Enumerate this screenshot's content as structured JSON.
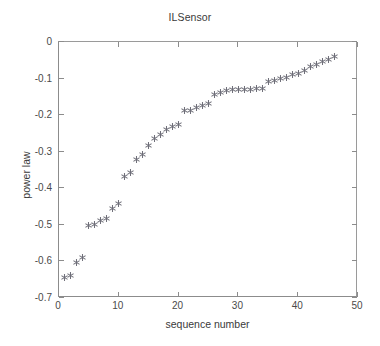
{
  "chart_data": {
    "type": "scatter",
    "title": "ILSensor",
    "xlabel": "sequence number",
    "ylabel": "power law",
    "xlim": [
      0,
      50
    ],
    "ylim": [
      -0.7,
      0
    ],
    "xticks": [
      0,
      10,
      20,
      30,
      40,
      50
    ],
    "yticks": [
      0,
      -0.1,
      -0.2,
      -0.3,
      -0.4,
      -0.5,
      -0.6,
      -0.7
    ],
    "xtick_labels": [
      "0",
      "10",
      "20",
      "30",
      "40",
      "50"
    ],
    "ytick_labels": [
      "0",
      "-0.1",
      "-0.2",
      "-0.3",
      "-0.4",
      "-0.5",
      "-0.6",
      "-0.7"
    ],
    "grid": false,
    "legend": null,
    "marker": "asterisk",
    "marker_color": "#6e6e78",
    "axis_color": "#8c8c8c",
    "background": "#ffffff",
    "series": [
      {
        "name": "power law",
        "x": [
          1,
          2,
          3,
          4,
          5,
          6,
          7,
          8,
          9,
          10,
          11,
          12,
          13,
          14,
          15,
          16,
          17,
          18,
          19,
          20,
          21,
          22,
          23,
          24,
          25,
          26,
          27,
          28,
          29,
          30,
          31,
          32,
          33,
          34,
          35,
          36,
          37,
          38,
          39,
          40,
          41,
          42,
          43,
          44,
          45,
          46
        ],
        "y": [
          -0.645,
          -0.638,
          -0.603,
          -0.59,
          -0.503,
          -0.5,
          -0.487,
          -0.483,
          -0.455,
          -0.442,
          -0.367,
          -0.357,
          -0.32,
          -0.307,
          -0.283,
          -0.265,
          -0.253,
          -0.238,
          -0.232,
          -0.225,
          -0.187,
          -0.187,
          -0.18,
          -0.174,
          -0.168,
          -0.143,
          -0.138,
          -0.132,
          -0.13,
          -0.13,
          -0.129,
          -0.129,
          -0.128,
          -0.126,
          -0.108,
          -0.104,
          -0.1,
          -0.096,
          -0.09,
          -0.085,
          -0.078,
          -0.068,
          -0.062,
          -0.054,
          -0.048,
          -0.04
        ]
      }
    ]
  }
}
